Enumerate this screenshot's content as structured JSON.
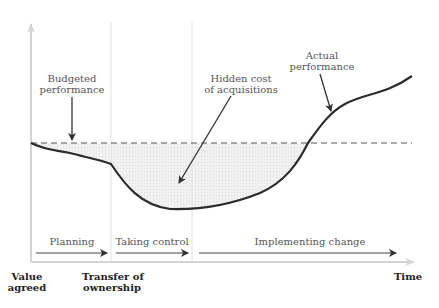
{
  "diagram": {
    "annotations": {
      "budgeted": [
        "Budgeted",
        "performance"
      ],
      "hidden_cost": [
        "Hidden cost",
        "of acquisitions"
      ],
      "actual": [
        "Actual",
        "performance"
      ]
    },
    "phases": [
      {
        "label": "Planning"
      },
      {
        "label": "Taking control"
      },
      {
        "label": "Implementing change"
      }
    ],
    "x_axis": {
      "milestones": [
        {
          "line1": "Value",
          "line2": "agreed"
        },
        {
          "line1": "Transfer of",
          "line2": "ownership"
        }
      ],
      "label": "Time"
    },
    "colors": {
      "curve": "#2b2b2b",
      "shade": "#ededed",
      "axis": "#cfcfcf",
      "dashed": "#555555",
      "text": "#555555"
    }
  }
}
